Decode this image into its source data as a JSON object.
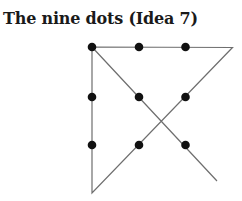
{
  "title": "The nine dots (Idea 7)",
  "diagram": {
    "dot_color": "#111111",
    "line_color": "#6e6e6e",
    "dot_radius": 4.3,
    "dots": [
      {
        "cx": 92,
        "cy": 47
      },
      {
        "cx": 139,
        "cy": 47
      },
      {
        "cx": 185.5,
        "cy": 47
      },
      {
        "cx": 92,
        "cy": 97
      },
      {
        "cx": 139,
        "cy": 97
      },
      {
        "cx": 185.5,
        "cy": 97
      },
      {
        "cx": 92,
        "cy": 145
      },
      {
        "cx": 139,
        "cy": 145
      },
      {
        "cx": 185.5,
        "cy": 145
      }
    ],
    "path": [
      {
        "x": 217,
        "y": 181
      },
      {
        "x": 92,
        "y": 47
      },
      {
        "x": 232.5,
        "y": 47.5
      },
      {
        "x": 92,
        "y": 193
      },
      {
        "x": 92,
        "y": 47
      }
    ]
  }
}
